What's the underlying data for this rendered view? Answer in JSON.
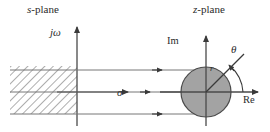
{
  "figure": {
    "background_color": "#ffffff",
    "line_color": "#555555",
    "text_color": "#2b2b2b",
    "disk_fill_color": "#a0a0a0"
  },
  "left_panel": {
    "plane_label_prefix": "s",
    "plane_label_suffix": "-plane",
    "vertical_axis_label": "jω",
    "horizontal_axis_label": "σ",
    "shaded_region": "left-half plane (hatched)"
  },
  "right_panel": {
    "plane_label_prefix": "z",
    "plane_label_suffix": "-plane",
    "vertical_axis_label": "Im",
    "horizontal_axis_label": "Re",
    "radius_label": "r",
    "angle_label": "θ",
    "disk": "unit disk (shaded)"
  },
  "icons": {
    "arrow": "arrow-icon",
    "hatch": "hatch-pattern-icon",
    "arc": "angle-arc-icon"
  }
}
